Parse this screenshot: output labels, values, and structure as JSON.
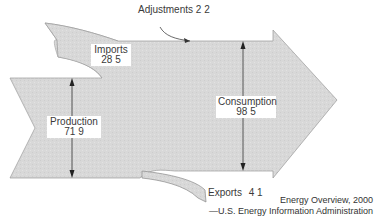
{
  "diagram": {
    "type": "energy-flow",
    "units_note": "",
    "flows": [
      {
        "id": "adjustments",
        "label": "Adjustments",
        "value": "2 2",
        "direction": "in"
      },
      {
        "id": "imports",
        "label": "Imports",
        "value": "28 5",
        "direction": "in"
      },
      {
        "id": "production",
        "label": "Production",
        "value": "71 9",
        "direction": "in"
      },
      {
        "id": "consumption",
        "label": "Consumption",
        "value": "98 5",
        "direction": "out"
      },
      {
        "id": "exports",
        "label": "Exports",
        "value": "4 1",
        "direction": "out"
      }
    ],
    "colors": {
      "fill": "#d9d9d9",
      "stroke": "#9a9a9a",
      "text": "#3a3a3a"
    }
  },
  "caption": {
    "title": "Energy Overview, 2000",
    "source": "—U.S. Energy Information Administration"
  }
}
